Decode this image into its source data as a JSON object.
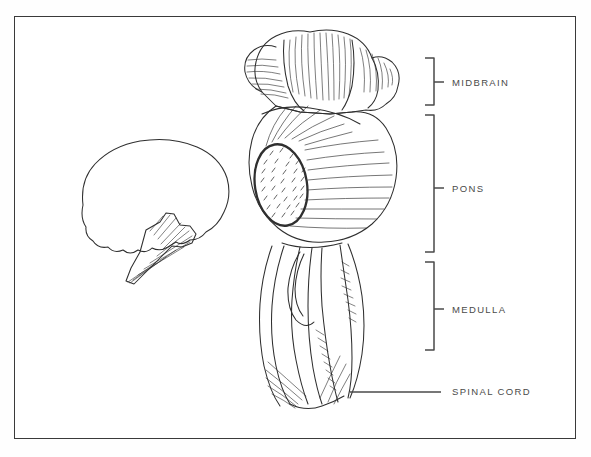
{
  "figure": {
    "background_color": "#ffffff",
    "frame_color": "#3a3a3a",
    "ink_color": "#2f2f2f",
    "label_color": "#4a4a4a"
  },
  "labels": [
    {
      "id": "midbrain",
      "text": "MIDBRAIN",
      "marker": "bracket",
      "bracket_top": 58,
      "bracket_bottom": 105
    },
    {
      "id": "pons",
      "text": "PONS",
      "marker": "bracket",
      "bracket_top": 115,
      "bracket_bottom": 252
    },
    {
      "id": "medulla",
      "text": "MEDULLA",
      "marker": "bracket",
      "bracket_top": 262,
      "bracket_bottom": 350
    },
    {
      "id": "spinal_cord",
      "text": "SPINAL CORD",
      "marker": "leader-line",
      "line_y": 392,
      "line_x_start": 350,
      "line_x_end": 441
    }
  ],
  "illustrations": [
    {
      "id": "brainstem-main",
      "description": "Posterior view of brainstem: midbrain, pons with oval middle cerebellar peduncle, medulla"
    },
    {
      "id": "brain-inset",
      "description": "Small lateral silhouette of cerebrum with hatched brainstem"
    }
  ]
}
